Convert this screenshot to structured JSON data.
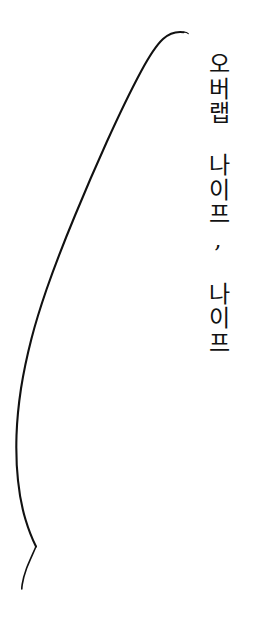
{
  "canvas": {
    "width": 253,
    "height": 633,
    "background_color": "#ffffff"
  },
  "caption": {
    "text": "오버랩 나이프, 나이프",
    "orientation": "vertical-upright",
    "color": "#121212",
    "font_size_px": 23
  },
  "artwork": {
    "name": "overlap-knife-curve",
    "stroke_color": "#111111",
    "stroke_width_px": 2.1,
    "description": "single tapered curved line"
  }
}
